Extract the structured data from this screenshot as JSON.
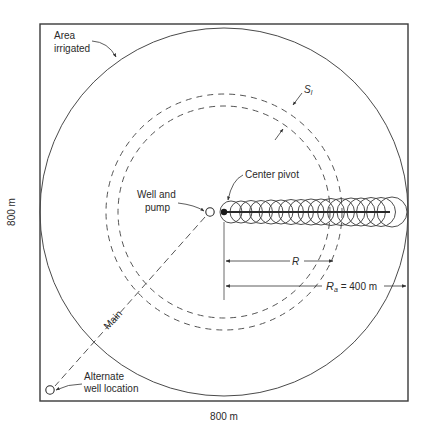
{
  "diagram": {
    "type": "center-pivot irrigation layout",
    "field": {
      "width_label": "800 m",
      "height_label": "800 m"
    },
    "labels": {
      "area_irrigated_line1": "Area",
      "area_irrigated_line2": "irrigated",
      "well_line1": "Well and",
      "well_line2": "pump",
      "center_pivot": "Center pivot",
      "main": "Main",
      "alternate_line1": "Alternate",
      "alternate_line2": "well location",
      "spacing_symbol": "S",
      "spacing_subscript": "l",
      "radius_symbol": "R",
      "outer_radius_symbol": "R",
      "outer_radius_subscript": "a",
      "outer_radius_value": " = 400 m"
    },
    "colors": {
      "line": "#3a3a3a",
      "dash": "#555555",
      "text": "#2a2a2a",
      "background": "#ffffff"
    }
  }
}
